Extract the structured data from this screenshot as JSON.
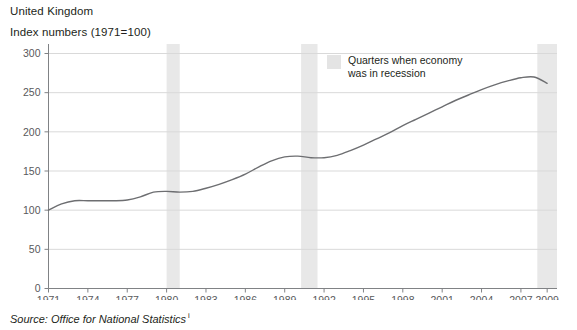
{
  "header": {
    "region": "United Kingdom",
    "units": "Index numbers (1971=100)"
  },
  "legend": {
    "label": "Quarters when economy\nwas in recession",
    "swatch_color": "#e4e4e4"
  },
  "source": {
    "text": "Source: Office for National Statistics",
    "footnote_marker": "i"
  },
  "colors": {
    "line": "#6d6e71",
    "grid": "#d9d9d9",
    "axis": "#808285",
    "recession_band": "#e8e8e8",
    "text": "#231f20",
    "tick_text": "#58595b"
  },
  "chart_data": {
    "type": "line",
    "title": "United Kingdom",
    "subtitle": "Index numbers (1971=100)",
    "xlabel": "",
    "ylabel": "",
    "xlim": [
      1971,
      2009.75
    ],
    "ylim": [
      0,
      300
    ],
    "yticks": [
      0,
      50,
      100,
      150,
      200,
      250,
      300
    ],
    "xticks": [
      1971,
      1974,
      1977,
      1980,
      1983,
      1986,
      1989,
      1992,
      1995,
      1998,
      2001,
      2004,
      2007,
      2009
    ],
    "grid": "horizontal",
    "legend_position": "top-right-inside",
    "series": [
      {
        "name": "Index numbers (1971=100)",
        "x": [
          1971,
          1972,
          1973,
          1974,
          1975,
          1976,
          1977,
          1978,
          1979,
          1980,
          1981,
          1982,
          1983,
          1984,
          1985,
          1986,
          1987,
          1988,
          1989,
          1990,
          1991,
          1992,
          1993,
          1994,
          1995,
          1996,
          1997,
          1998,
          1999,
          2000,
          2001,
          2002,
          2003,
          2004,
          2005,
          2006,
          2007,
          2008,
          2009
        ],
        "values": [
          100,
          108,
          112,
          112,
          112,
          112,
          113,
          117,
          123,
          124,
          123,
          124,
          128,
          133,
          139,
          146,
          155,
          163,
          168,
          169,
          167,
          167,
          170,
          176,
          183,
          191,
          199,
          208,
          216,
          224,
          232,
          240,
          247,
          254,
          260,
          265,
          269,
          270,
          262
        ]
      }
    ],
    "recession_bands": [
      {
        "label": "1980 recession",
        "start": 1980.0,
        "end": 1981.0
      },
      {
        "label": "1990-91 recession",
        "start": 1990.25,
        "end": 1991.5
      },
      {
        "label": "2008-09 recession",
        "start": 2008.25,
        "end": 2009.75
      }
    ]
  }
}
